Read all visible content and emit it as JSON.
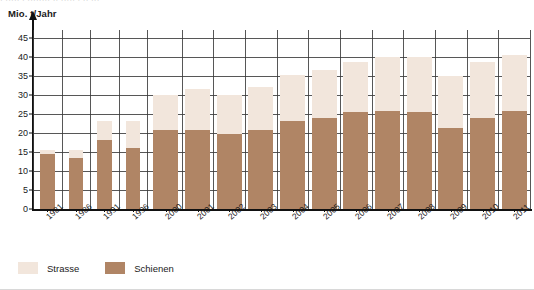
{
  "caption_strip": "· ····· · ········ ·· ····· · ·· ···",
  "axis_title": "Mio. t/Jahr",
  "legend": {
    "items": [
      {
        "label": "Strasse",
        "color": "#f2e6dc",
        "name": "strasse"
      },
      {
        "label": "Schienen",
        "color": "#b08565",
        "name": "schienen"
      }
    ]
  },
  "colors": {
    "road": "#f2e6dc",
    "rail": "#b08565",
    "grid": "#3a3a3a",
    "axis": "#111111"
  },
  "chart_data": {
    "type": "bar",
    "title": "",
    "subtitle": "",
    "xlabel": "",
    "ylabel": "Mio. t/Jahr",
    "ylim": [
      0,
      47
    ],
    "yticks": [
      0,
      5,
      10,
      15,
      20,
      25,
      30,
      35,
      40,
      45
    ],
    "grid": true,
    "stacked": true,
    "legend_position": "bottom-left",
    "categories": [
      "1981",
      "1986",
      "1991",
      "1996",
      "2000",
      "2001",
      "2002",
      "2003",
      "2004",
      "2005",
      "2006",
      "2007",
      "2008",
      "2009",
      "2010",
      "2011"
    ],
    "series": [
      {
        "name": "Schienen",
        "color": "#b08565",
        "values": [
          14.5,
          13.3,
          18.0,
          16.0,
          20.7,
          20.8,
          19.6,
          20.7,
          23.0,
          23.8,
          25.4,
          25.7,
          25.6,
          21.3,
          24.0,
          25.7
        ]
      },
      {
        "name": "Strasse",
        "color": "#f2e6dc",
        "values": [
          1.1,
          2.2,
          5.0,
          7.0,
          9.3,
          10.7,
          10.4,
          11.3,
          12.3,
          12.7,
          13.1,
          14.3,
          14.4,
          13.7,
          14.5,
          14.8
        ]
      }
    ],
    "totals": [
      15.6,
      15.5,
      23.0,
      23.0,
      30.0,
      31.5,
      30.0,
      32.0,
      35.3,
      36.5,
      38.5,
      40.0,
      40.0,
      35.0,
      38.5,
      40.5
    ]
  }
}
